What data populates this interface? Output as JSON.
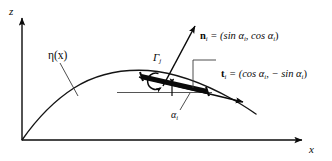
{
  "figure": {
    "background_color": "#ffffff",
    "ink_color": "#0a0a0a",
    "width": 332,
    "height": 161
  },
  "axes": {
    "z_label": "z",
    "x_label": "x",
    "origin": [
      22,
      140
    ],
    "z_tip": [
      22,
      14
    ],
    "x_tip": [
      306,
      140
    ]
  },
  "curve": {
    "label": "η(x)",
    "label_plain": "eta(x)",
    "description": "free-surface elevation profile",
    "leader_from": [
      60,
      62
    ],
    "leader_to": [
      78,
      95
    ],
    "path_points": [
      [
        22,
        140
      ],
      [
        40,
        118
      ],
      [
        58,
        100
      ],
      [
        78,
        86
      ],
      [
        100,
        77
      ],
      [
        122,
        72
      ],
      [
        142,
        70
      ],
      [
        160,
        71
      ],
      [
        180,
        75
      ],
      [
        200,
        82
      ],
      [
        220,
        91
      ],
      [
        240,
        101
      ],
      [
        255,
        110
      ]
    ]
  },
  "panel": {
    "name": "vortex-panel-element",
    "start": [
      141,
      76
    ],
    "end": [
      208,
      92
    ],
    "thickness_px": 5,
    "color": "#0a0a0a"
  },
  "circulation": {
    "symbol": "Γ",
    "subscript": "j",
    "label": "Γj",
    "direction": "counterclockwise",
    "center": [
      152,
      80
    ],
    "radius": 8,
    "label_pos": [
      157,
      55
    ]
  },
  "normal_vector": {
    "symbol": "n",
    "subscript": "i",
    "equation": " = (sin α",
    "equation_mid": ", cos α",
    "equation_end": ")",
    "full_text": "n_i = (sin α_i, cos α_i)",
    "arrow_from": [
      163,
      85
    ],
    "arrow_to": [
      196,
      24
    ],
    "label_pos": [
      201,
      32
    ]
  },
  "tangent_vector": {
    "symbol": "t",
    "subscript": "i",
    "equation": " = (cos α",
    "equation_mid": ", − sin α",
    "equation_end": ")",
    "full_text": "t_i = (cos α_i, − sin α_i)",
    "arrow_from": [
      143,
      78
    ],
    "arrow_to": [
      245,
      103
    ],
    "label_pos": [
      222,
      68
    ],
    "leader_points": [
      [
        218,
        62
      ],
      [
        193,
        62
      ],
      [
        193,
        86
      ]
    ]
  },
  "angle": {
    "symbol": "α",
    "subscript": "i",
    "label": "αi",
    "description": "panel inclination angle from horizontal",
    "vertex": [
      172,
      86
    ],
    "reference_line_from": [
      117,
      92
    ],
    "reference_line_to": [
      212,
      92
    ],
    "leader_from": [
      178,
      114
    ],
    "leader_to": [
      189,
      93
    ],
    "label_pos": [
      173,
      112
    ]
  }
}
